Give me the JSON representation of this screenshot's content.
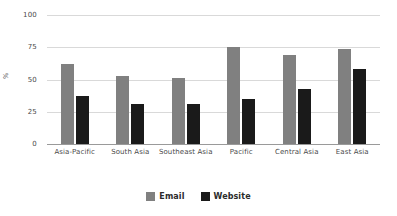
{
  "chart_data": {
    "type": "bar",
    "title": "",
    "xlabel": "",
    "ylabel": "%",
    "ylim": [
      0,
      100
    ],
    "yticks": [
      0,
      25,
      50,
      75,
      100
    ],
    "grid": true,
    "legend_position": "bottom",
    "categories": [
      "Asia-Pacific",
      "South Asia",
      "Southeast Asia",
      "Pacific",
      "Central Asia",
      "East Asia"
    ],
    "series": [
      {
        "name": "Email",
        "color": "#808080",
        "values": [
          62,
          53,
          51,
          75,
          69,
          74
        ]
      },
      {
        "name": "Website",
        "color": "#1a1a1a",
        "values": [
          37,
          31,
          31,
          35,
          43,
          58
        ]
      }
    ]
  }
}
